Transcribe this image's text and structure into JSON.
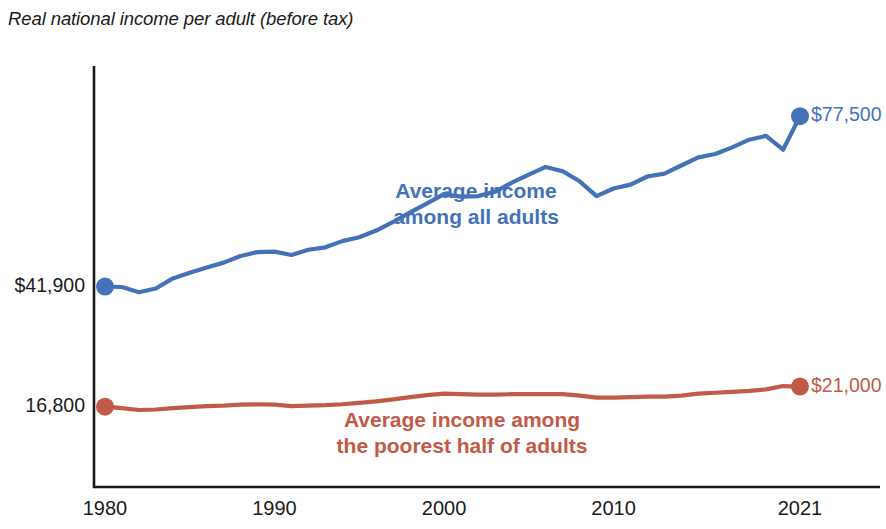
{
  "figure": {
    "title": "Real national income per adult (before tax)",
    "width": 886,
    "height": 529
  },
  "colors": {
    "all_adults": "#4472b8",
    "poorest_half": "#c25a47",
    "axis": "#1a1a1a",
    "text": "#1b1b1b",
    "background": "#ffffff"
  },
  "axes": {
    "x_ticks": [
      {
        "label": "1980",
        "value": 1980
      },
      {
        "label": "1990",
        "value": 1990
      },
      {
        "label": "2000",
        "value": 2000
      },
      {
        "label": "2010",
        "value": 2010
      },
      {
        "label": "2021",
        "value": 2021
      }
    ],
    "y_ticks": [
      {
        "label": "$41,900",
        "value": 41900
      },
      {
        "label": "16,800",
        "value": 16800
      }
    ],
    "xlim": [
      1980,
      2021
    ],
    "ylim": [
      0,
      88000
    ],
    "grid": false
  },
  "annotations": [
    {
      "name": "all-adults",
      "line1": "Average income",
      "line2": "among all adults",
      "color": "#4472b8"
    },
    {
      "name": "poorest-half",
      "line1": "Average income among",
      "line2": "the poorest half of adults",
      "color": "#c25a47"
    }
  ],
  "endpoint_labels": [
    {
      "name": "all-adults-end",
      "text": "$77,500",
      "color": "#4472b8"
    },
    {
      "name": "poorest-half-end",
      "text": "$21,000",
      "color": "#c25a47"
    }
  ],
  "start_markers": [
    {
      "name": "all-adults-start",
      "value": 41900,
      "color": "#4472b8"
    },
    {
      "name": "poorest-half-start",
      "value": 16800,
      "color": "#c25a47"
    }
  ],
  "chart_data": {
    "type": "line",
    "title": "Real national income per adult (before tax)",
    "xlabel": "",
    "ylabel": "",
    "xlim": [
      1980,
      2021
    ],
    "ylim": [
      0,
      88000
    ],
    "grid": false,
    "legend": "inline-annotations",
    "x": [
      1980,
      1981,
      1982,
      1983,
      1984,
      1985,
      1986,
      1987,
      1988,
      1989,
      1990,
      1991,
      1992,
      1993,
      1994,
      1995,
      1996,
      1997,
      1998,
      1999,
      2000,
      2001,
      2002,
      2003,
      2004,
      2005,
      2006,
      2007,
      2008,
      2009,
      2010,
      2011,
      2012,
      2013,
      2014,
      2015,
      2016,
      2017,
      2018,
      2019,
      2020,
      2021
    ],
    "series": [
      {
        "name": "Average income among all adults",
        "color": "#4472b8",
        "start_label": "$41,900",
        "end_label": "$77,500",
        "values": [
          41900,
          41800,
          40700,
          41500,
          43600,
          44800,
          45900,
          46900,
          48300,
          49100,
          49200,
          48500,
          49600,
          50100,
          51400,
          52200,
          53600,
          55400,
          57400,
          59300,
          61200,
          60700,
          60800,
          61700,
          63600,
          65300,
          66900,
          66000,
          63900,
          60800,
          62400,
          63200,
          64900,
          65500,
          67200,
          68900,
          69600,
          71000,
          72600,
          73400,
          70500,
          77500
        ]
      },
      {
        "name": "Average income among the poorest half of adults",
        "color": "#c25a47",
        "start_label": "16,800",
        "end_label": "$21,000",
        "values": [
          16800,
          16500,
          16100,
          16200,
          16500,
          16700,
          16900,
          17000,
          17200,
          17300,
          17200,
          16900,
          17000,
          17100,
          17300,
          17600,
          17900,
          18300,
          18800,
          19200,
          19500,
          19400,
          19300,
          19300,
          19400,
          19400,
          19400,
          19400,
          19100,
          18700,
          18700,
          18800,
          18900,
          18900,
          19100,
          19500,
          19700,
          19900,
          20100,
          20400,
          21100,
          21000
        ]
      }
    ]
  }
}
